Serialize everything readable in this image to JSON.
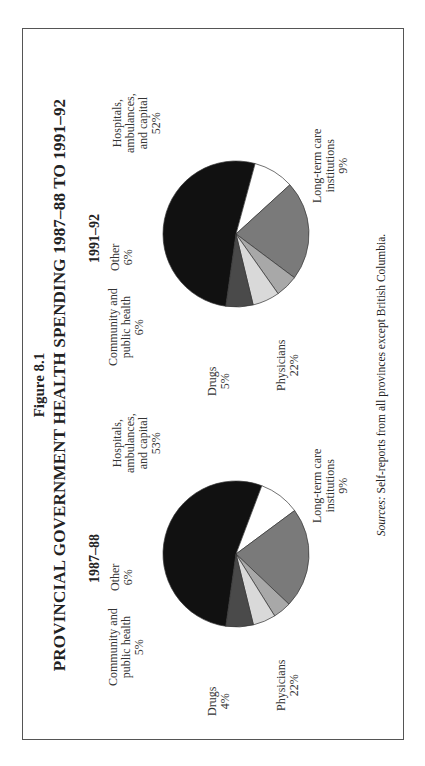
{
  "figure": {
    "label": "Figure 8.1",
    "title": "PROVINCIAL GOVERNMENT HEALTH SPENDING 1987–88 TO 1991–92",
    "sources_prefix": "Sources:",
    "sources_text": " Self-reports from all provinces except British Columbia.",
    "orientation": "rotated 90° counter-clockwise on page"
  },
  "chart_data": [
    {
      "type": "pie",
      "title": "1987–88",
      "categories": [
        "Hospitals, ambulances, and capital",
        "Long-term care institutions",
        "Physicians",
        "Drugs",
        "Community and public health",
        "Other"
      ],
      "values": [
        53,
        9,
        22,
        4,
        5,
        6
      ],
      "unit": "%",
      "colors": [
        "#111111",
        "#ffffff",
        "#7a7a7a",
        "#a8a8a8",
        "#d9d9d9",
        "#4a4a4a"
      ]
    },
    {
      "type": "pie",
      "title": "1991–92",
      "categories": [
        "Hospitals, ambulances, and capital",
        "Long-term care institutions",
        "Physicians",
        "Drugs",
        "Community and public health",
        "Other"
      ],
      "values": [
        52,
        9,
        22,
        5,
        6,
        6
      ],
      "unit": "%",
      "colors": [
        "#111111",
        "#ffffff",
        "#7a7a7a",
        "#a8a8a8",
        "#d9d9d9",
        "#4a4a4a"
      ]
    }
  ],
  "labels": {
    "p1": {
      "year": "1987–88",
      "hosp": [
        "Hospitals,",
        "ambulances,",
        "and capital",
        "53%"
      ],
      "ltc": [
        "Long-term care",
        "institutions",
        "9%"
      ],
      "phys": [
        "Physicians",
        "22%"
      ],
      "drugs": [
        "Drugs",
        "4%"
      ],
      "comm": [
        "Community and",
        "public health",
        "5%"
      ],
      "other": [
        "Other",
        "6%"
      ]
    },
    "p2": {
      "year": "1991–92",
      "hosp": [
        "Hospitals,",
        "ambulances,",
        "and capital",
        "52%"
      ],
      "ltc": [
        "Long-term care",
        "institutions",
        "9%"
      ],
      "phys": [
        "Physicians",
        "22%"
      ],
      "drugs": [
        "Drugs",
        "5%"
      ],
      "comm": [
        "Community and",
        "public health",
        "6%"
      ],
      "other": [
        "Other",
        "6%"
      ]
    }
  }
}
